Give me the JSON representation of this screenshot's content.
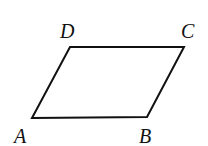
{
  "diagram": {
    "type": "parallelogram",
    "vertices": [
      {
        "label": "A",
        "x": 32,
        "y": 118,
        "lx": 14,
        "ly": 143
      },
      {
        "label": "B",
        "x": 147,
        "y": 117,
        "lx": 139,
        "ly": 143
      },
      {
        "label": "C",
        "x": 184,
        "y": 47,
        "lx": 181,
        "ly": 38
      },
      {
        "label": "D",
        "x": 70,
        "y": 47,
        "lx": 60,
        "ly": 38
      }
    ],
    "stroke": "#111111"
  }
}
